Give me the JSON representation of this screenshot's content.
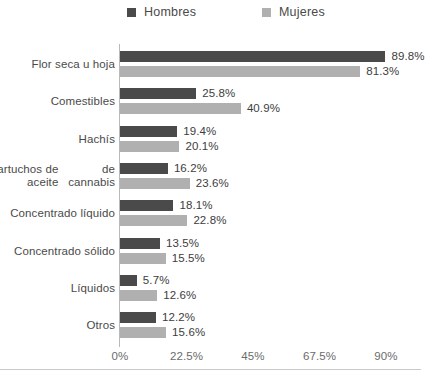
{
  "chart_data": {
    "type": "bar",
    "orientation": "horizontal",
    "title": "",
    "subtitle": "",
    "xlabel": "",
    "ylabel": "",
    "grid": false,
    "legend_position": "top",
    "xlim": [
      0,
      90
    ],
    "xticks": [
      "0%",
      "22.5%",
      "45%",
      "67.5%",
      "90%"
    ],
    "xtick_values": [
      0,
      22.5,
      45,
      67.5,
      90
    ],
    "categories": [
      "Flor seca u hoja",
      "Comestibles",
      "Hachís",
      "Cartuchos de aceite de cannabis",
      "Concentrado líquido",
      "Concentrado sólido",
      "Líquidos",
      "Otros"
    ],
    "series": [
      {
        "name": "Hombres",
        "color": "#4a4a4a",
        "values": [
          89.8,
          25.8,
          19.4,
          16.2,
          18.1,
          13.5,
          5.7,
          12.2
        ],
        "labels": [
          "89.8%",
          "25.8%",
          "19.4%",
          "16.2%",
          "18.1%",
          "13.5%",
          "5.7%",
          "12.2%"
        ]
      },
      {
        "name": "Mujeres",
        "color": "#b0b0b0",
        "values": [
          81.3,
          40.9,
          20.1,
          23.6,
          22.8,
          15.5,
          12.6,
          15.6
        ],
        "labels": [
          "81.3%",
          "40.9%",
          "20.1%",
          "23.6%",
          "22.8%",
          "15.5%",
          "12.6%",
          "15.6%"
        ]
      }
    ]
  },
  "legend": {
    "items": [
      {
        "label": "Hombres",
        "color": "#4a4a4a"
      },
      {
        "label": "Mujeres",
        "color": "#b0b0b0"
      }
    ]
  },
  "category_lines": [
    [
      "Flor seca u hoja"
    ],
    [
      "Comestibles"
    ],
    [
      "Hachís"
    ],
    [
      "Cartuchos de aceite",
      "de cannabis"
    ],
    [
      "Concentrado líquido"
    ],
    [
      "Concentrado sólido"
    ],
    [
      "Líquidos"
    ],
    [
      "Otros"
    ]
  ]
}
